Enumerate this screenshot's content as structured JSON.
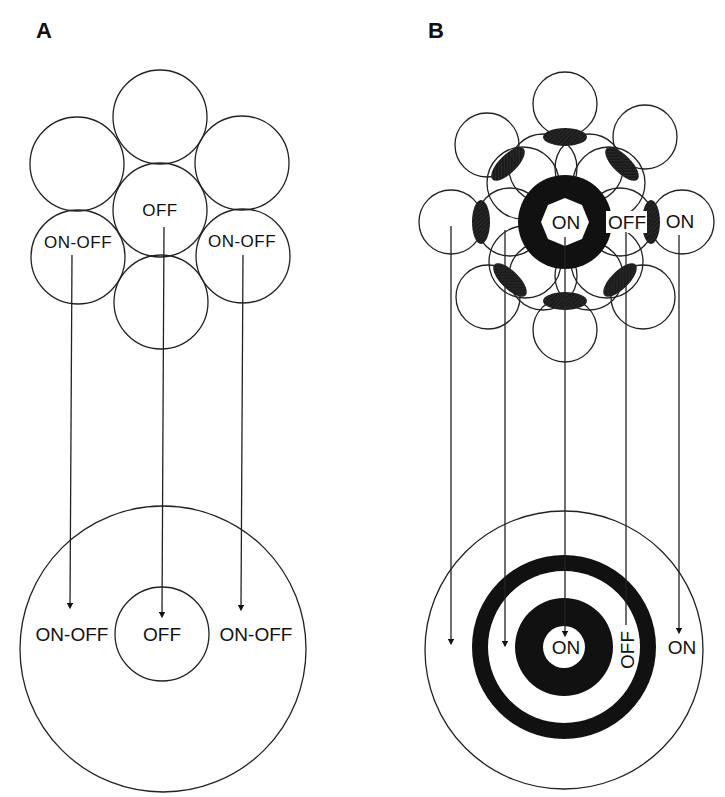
{
  "figure": {
    "panels": [
      {
        "label": "A",
        "receptor_labels": {
          "center": "OFF",
          "left": "ON-OFF",
          "right": "ON-OFF"
        },
        "target_labels": {
          "left": "ON-OFF",
          "center": "OFF",
          "right": "ON-OFF"
        }
      },
      {
        "label": "B",
        "receptor_labels": {
          "center": "ON",
          "ring": "OFF",
          "outer": "ON"
        },
        "target_labels": {
          "center": "ON",
          "ring": "OFF",
          "outer": "ON"
        }
      }
    ],
    "colors": {
      "ink": "#111111",
      "background": "#ffffff"
    }
  }
}
